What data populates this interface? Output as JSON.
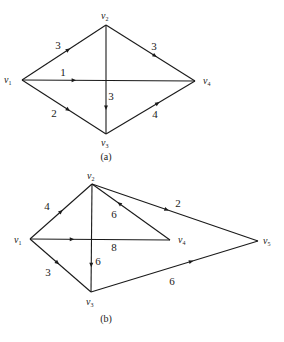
{
  "diagrams": [
    {
      "id": "a",
      "caption": "(a)",
      "caption_pos": [
        106,
        160
      ],
      "nodes": [
        {
          "id": "v1",
          "label": "v",
          "sub": "1",
          "x": 22,
          "y": 80,
          "lx": 4,
          "ly": 83
        },
        {
          "id": "v2",
          "label": "v",
          "sub": "2",
          "x": 106,
          "y": 25,
          "lx": 101,
          "ly": 19
        },
        {
          "id": "v3",
          "label": "v",
          "sub": "3",
          "x": 106,
          "y": 134,
          "lx": 101,
          "ly": 146
        },
        {
          "id": "v4",
          "label": "v",
          "sub": "4",
          "x": 195,
          "y": 81,
          "lx": 203,
          "ly": 84
        }
      ],
      "edges": [
        {
          "from": "v1",
          "to": "v2",
          "weight": "3",
          "t": 0.55,
          "lx": 58,
          "ly": 49
        },
        {
          "from": "v2",
          "to": "v4",
          "weight": "3",
          "t": 0.55,
          "lx": 154,
          "ly": 50
        },
        {
          "from": "v1",
          "to": "v4",
          "weight": "1",
          "t": 0.3,
          "lx": 63,
          "ly": 76
        },
        {
          "from": "v2",
          "to": "v3",
          "weight": "3",
          "t": 0.76,
          "lx": 111,
          "ly": 100
        },
        {
          "from": "v1",
          "to": "v3",
          "weight": "2",
          "t": 0.55,
          "lx": 54,
          "ly": 117
        },
        {
          "from": "v3",
          "to": "v4",
          "weight": "4",
          "t": 0.58,
          "lx": 155,
          "ly": 118
        }
      ]
    },
    {
      "id": "b",
      "caption": "(b)",
      "caption_pos": [
        106,
        322
      ],
      "nodes": [
        {
          "id": "v1",
          "label": "v",
          "sub": "1",
          "x": 30,
          "y": 239,
          "lx": 14,
          "ly": 243
        },
        {
          "id": "v2",
          "label": "v",
          "sub": "2",
          "x": 92,
          "y": 184,
          "lx": 87,
          "ly": 179
        },
        {
          "id": "v3",
          "label": "v",
          "sub": "3",
          "x": 91,
          "y": 292,
          "lx": 86,
          "ly": 305
        },
        {
          "id": "v4",
          "label": "v",
          "sub": "4",
          "x": 170,
          "y": 240,
          "lx": 178,
          "ly": 243
        },
        {
          "id": "v5",
          "label": "v",
          "sub": "5",
          "x": 258,
          "y": 241,
          "lx": 263,
          "ly": 244
        }
      ],
      "edges": [
        {
          "from": "v1",
          "to": "v2",
          "weight": "4",
          "t": 0.5,
          "lx": 47,
          "ly": 210
        },
        {
          "from": "v1",
          "to": "v4",
          "weight": "8",
          "t": 0.3,
          "lx": 114,
          "ly": 251
        },
        {
          "from": "v1",
          "to": "v3",
          "weight": "3",
          "t": 0.45,
          "lx": 48,
          "ly": 276
        },
        {
          "from": "v2",
          "to": "v3",
          "weight": "6",
          "t": 0.75,
          "lx": 98,
          "ly": 265
        },
        {
          "from": "v4",
          "to": "v2",
          "weight": "6",
          "t": 0.65,
          "lx": 114,
          "ly": 218
        },
        {
          "from": "v2",
          "to": "v5",
          "weight": "2",
          "t": 0.45,
          "lx": 178,
          "ly": 207
        },
        {
          "from": "v3",
          "to": "v5",
          "weight": "6",
          "t": 0.6,
          "lx": 172,
          "ly": 285
        }
      ]
    }
  ]
}
